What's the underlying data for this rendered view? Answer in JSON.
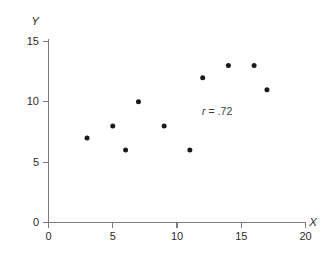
{
  "chart_data": {
    "type": "scatter",
    "title": "",
    "subtitle": "",
    "xlabel": "X",
    "ylabel": "Y",
    "xlim": [
      0,
      20
    ],
    "ylim": [
      0,
      15
    ],
    "xticks": [
      0,
      5,
      10,
      15,
      20
    ],
    "yticks": [
      0,
      5,
      10,
      15
    ],
    "xtick_labels": [
      "0",
      "5",
      "10",
      "15",
      "20"
    ],
    "ytick_labels": [
      "0",
      "5",
      "10",
      "15"
    ],
    "grid": false,
    "legend": null,
    "series": [
      {
        "name": "observations",
        "marker": "circle",
        "color": "#1a1a1a",
        "points": [
          {
            "x": 3,
            "y": 7
          },
          {
            "x": 5,
            "y": 8
          },
          {
            "x": 6,
            "y": 6
          },
          {
            "x": 7,
            "y": 10
          },
          {
            "x": 9,
            "y": 8
          },
          {
            "x": 11,
            "y": 6
          },
          {
            "x": 12,
            "y": 12
          },
          {
            "x": 14,
            "y": 13
          },
          {
            "x": 16,
            "y": 13
          },
          {
            "x": 17,
            "y": 11
          }
        ]
      }
    ],
    "annotations": [
      {
        "name": "correlation-coefficient",
        "symbol": "r",
        "operator": "=",
        "value": ".72",
        "text": "r = .72",
        "x": 12.0,
        "y": 8.9
      }
    ]
  },
  "axes": {
    "x_title": "X",
    "y_title": "Y"
  },
  "colors": {
    "axis": "#7d7d7d",
    "text": "#2b2b2b",
    "marker": "#1a1a1a",
    "background": "#ffffff"
  }
}
